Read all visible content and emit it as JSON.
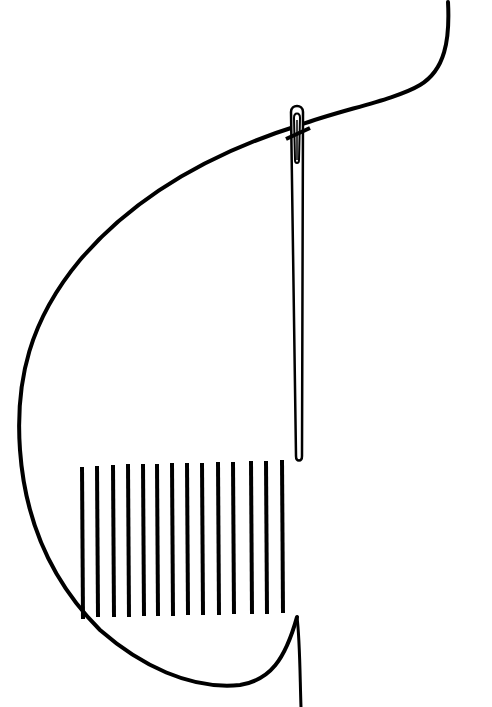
{
  "illustration": {
    "subject": "needle-and-thread-satin-stitch",
    "colors": {
      "line": "#000000",
      "background": "#ffffff"
    },
    "stitch_count": 14,
    "stitches": [
      {
        "x": 82,
        "y1": 467,
        "y2": 619
      },
      {
        "x": 97,
        "y1": 466,
        "y2": 617
      },
      {
        "x": 113,
        "y1": 465,
        "y2": 617
      },
      {
        "x": 128,
        "y1": 464,
        "y2": 617
      },
      {
        "x": 143,
        "y1": 464,
        "y2": 616
      },
      {
        "x": 157,
        "y1": 464,
        "y2": 616
      },
      {
        "x": 172,
        "y1": 463,
        "y2": 616
      },
      {
        "x": 187,
        "y1": 463,
        "y2": 615
      },
      {
        "x": 202,
        "y1": 463,
        "y2": 615
      },
      {
        "x": 218,
        "y1": 462,
        "y2": 615
      },
      {
        "x": 233,
        "y1": 462,
        "y2": 614
      },
      {
        "x": 251,
        "y1": 461,
        "y2": 614
      },
      {
        "x": 266,
        "y1": 461,
        "y2": 614
      },
      {
        "x": 282,
        "y1": 460,
        "y2": 613
      }
    ]
  }
}
